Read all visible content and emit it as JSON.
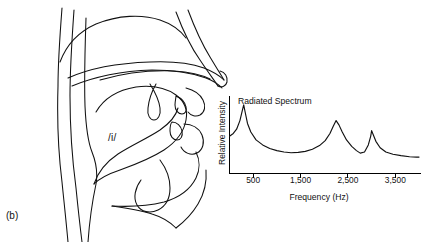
{
  "figure": {
    "panel_label": "(b)",
    "phoneme_label": "/i/",
    "diagram_name": "midsagittal-vocal-tract-vowel-i"
  },
  "chart_data": {
    "type": "line",
    "title": "Radiated Spectrum",
    "xlabel": "Frequency (Hz)",
    "ylabel": "Relative Intensity",
    "xlim": [
      0,
      4000
    ],
    "ylim": [
      0,
      1
    ],
    "grid": false,
    "legend": null,
    "tick_labels": [
      "500",
      "1,500",
      "2,500",
      "3,500"
    ],
    "ticks": [
      500,
      1500,
      2500,
      3500
    ],
    "formant_peaks_hz": [
      300,
      2250,
      3000
    ],
    "series": [
      {
        "name": "Radiated Spectrum",
        "x": [
          0,
          80,
          150,
          220,
          270,
          300,
          330,
          380,
          450,
          560,
          700,
          850,
          1000,
          1150,
          1300,
          1450,
          1600,
          1750,
          1900,
          2020,
          2120,
          2190,
          2250,
          2310,
          2380,
          2470,
          2580,
          2680,
          2760,
          2850,
          2930,
          2980,
          3000,
          3030,
          3090,
          3180,
          3300,
          3450,
          3620,
          3800,
          3950,
          4000
        ],
        "y": [
          0.52,
          0.56,
          0.62,
          0.74,
          0.88,
          0.96,
          0.86,
          0.7,
          0.58,
          0.47,
          0.4,
          0.35,
          0.32,
          0.3,
          0.29,
          0.295,
          0.31,
          0.34,
          0.39,
          0.46,
          0.56,
          0.66,
          0.74,
          0.68,
          0.58,
          0.47,
          0.38,
          0.32,
          0.285,
          0.3,
          0.4,
          0.52,
          0.6,
          0.55,
          0.45,
          0.36,
          0.3,
          0.27,
          0.25,
          0.235,
          0.23,
          0.23
        ]
      }
    ]
  },
  "colors": {
    "ink": "#111111",
    "background": "#ffffff",
    "axis": "#000000"
  }
}
